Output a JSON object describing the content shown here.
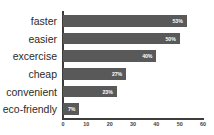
{
  "chart_data": {
    "type": "bar",
    "orientation": "horizontal",
    "title": "",
    "subtitle": "",
    "xlabel": "",
    "ylabel": "",
    "categories": [
      "faster",
      "easier",
      "excercise",
      "cheap",
      "convenient",
      "eco-friendly"
    ],
    "values": [
      53,
      50,
      40,
      27,
      23,
      7
    ],
    "data_labels": [
      "53%",
      "50%",
      "40%",
      "27%",
      "23%",
      "7%"
    ],
    "xlim": [
      0,
      60
    ],
    "xticks": [
      0,
      10,
      20,
      30,
      40,
      50,
      60
    ],
    "xtick_labels": [
      "0",
      "10",
      "20",
      "30",
      "40",
      "50",
      "60"
    ],
    "grid": false,
    "legend": null,
    "legend_position": "none",
    "bar_color": "#595959",
    "label_color": "#ffffff",
    "axis_color": "#3d3d3d",
    "background": "#ffffff"
  }
}
